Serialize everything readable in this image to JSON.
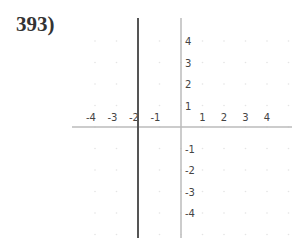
{
  "problem": {
    "number_label": "393)"
  },
  "chart_data": {
    "type": "line",
    "title": "",
    "xlabel": "",
    "ylabel": "",
    "x_ticks": [
      -4,
      -3,
      -2,
      -1,
      1,
      2,
      3,
      4
    ],
    "y_ticks": [
      4,
      3,
      2,
      1,
      -1,
      -2,
      -3,
      -4
    ],
    "xlim": [
      -5,
      5
    ],
    "ylim": [
      -5,
      5
    ],
    "grid": "faint dots",
    "series": [
      {
        "name": "x = -2",
        "kind": "vertical line",
        "x": -2,
        "color": "#555555"
      }
    ]
  },
  "layout": {
    "origin_px": [
      181,
      127
    ],
    "unit_px": 21.5,
    "x_axis_px": [
      72,
      292
    ],
    "y_axis_px": [
      18,
      238
    ],
    "axis_color": "#bbbbbb"
  }
}
